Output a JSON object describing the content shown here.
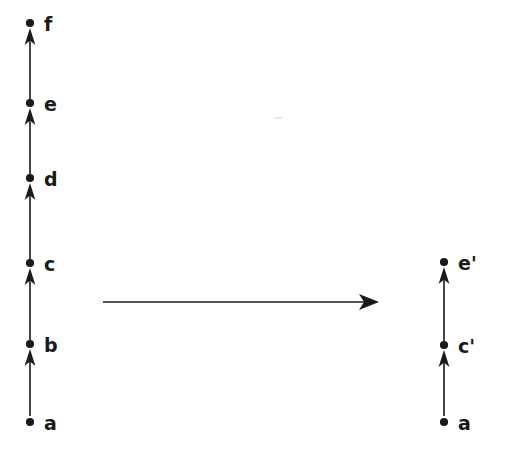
{
  "figure": {
    "background_color": "#ffffff",
    "ink_color": "#1a1a1a"
  },
  "left_column": {
    "name": "source-chain",
    "axis_x": 30,
    "vertices": [
      {
        "id": "a",
        "label": "a",
        "x": 30,
        "y": 422,
        "label_x": 44,
        "label_y": 414,
        "has_incoming_arrowhead": false
      },
      {
        "id": "b",
        "label": "b",
        "x": 30,
        "y": 344,
        "label_x": 44,
        "label_y": 336,
        "has_incoming_arrowhead": true
      },
      {
        "id": "c",
        "label": "c",
        "x": 30,
        "y": 263,
        "label_x": 44,
        "label_y": 255,
        "has_incoming_arrowhead": true
      },
      {
        "id": "d",
        "label": "d",
        "x": 30,
        "y": 178,
        "label_x": 44,
        "label_y": 170,
        "has_incoming_arrowhead": true
      },
      {
        "id": "e",
        "label": "e",
        "x": 30,
        "y": 103,
        "label_x": 44,
        "label_y": 95,
        "has_incoming_arrowhead": true
      },
      {
        "id": "f",
        "label": "f",
        "x": 30,
        "y": 23,
        "label_x": 44,
        "label_y": 15,
        "has_incoming_arrowhead": true
      }
    ],
    "edges": [
      {
        "from": "a",
        "to": "b"
      },
      {
        "from": "b",
        "to": "c"
      },
      {
        "from": "c",
        "to": "d"
      },
      {
        "from": "d",
        "to": "e"
      },
      {
        "from": "e",
        "to": "f"
      }
    ]
  },
  "right_column": {
    "name": "target-chain",
    "axis_x": 444,
    "vertices": [
      {
        "id": "a2",
        "label": "a",
        "x": 444,
        "y": 422,
        "label_x": 458,
        "label_y": 414,
        "has_incoming_arrowhead": false
      },
      {
        "id": "c2",
        "label": "c'",
        "x": 444,
        "y": 345,
        "label_x": 458,
        "label_y": 337,
        "has_incoming_arrowhead": true
      },
      {
        "id": "e2",
        "label": "e'",
        "x": 444,
        "y": 262,
        "label_x": 458,
        "label_y": 254,
        "has_incoming_arrowhead": true
      }
    ],
    "edges": [
      {
        "from": "a2",
        "to": "c2"
      },
      {
        "from": "c2",
        "to": "e2"
      }
    ]
  },
  "map_arrow": {
    "name": "chain-map-arrow",
    "label": "",
    "x_start": 103,
    "x_end": 379,
    "y": 302,
    "direction": "right"
  },
  "artifacts": [
    {
      "x": 274,
      "y": 117,
      "width": 8,
      "height": 2
    }
  ]
}
